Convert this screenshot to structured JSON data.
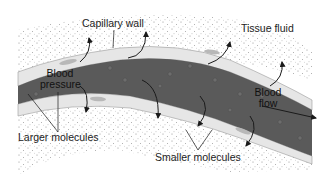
{
  "diagram": {
    "labels": {
      "capillary_wall": "Capillary wall",
      "tissue_fluid": "Tissue fluid",
      "blood_pressure_line1": "Blood",
      "blood_pressure_line2": "pressure",
      "blood_flow_line1": "Blood",
      "blood_flow_line2": "flow",
      "larger_molecules": "Larger molecules",
      "smaller_molecules": "Smaller molecules"
    },
    "colors": {
      "blood": "#5a5a5a",
      "wall": "#e6e6e6",
      "wall_outline": "#9a9a9a",
      "tissue_dots": "#8a8a8a",
      "text": "#222222",
      "arrows": "#1a1a1a"
    }
  }
}
